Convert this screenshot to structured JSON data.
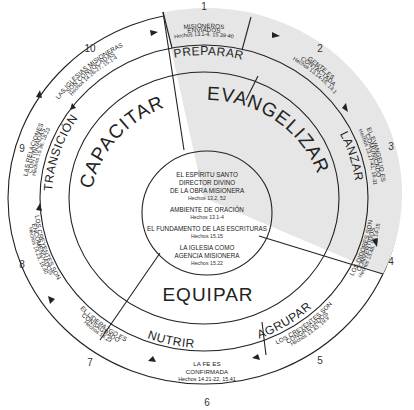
{
  "diagram": {
    "colors": {
      "shaded": "#e6e6e6",
      "white": "#ffffff",
      "line": "#222222"
    },
    "stages": [
      {
        "number": "1",
        "title_line1": "MISIONEROS",
        "title_line2": "ENVIADOS",
        "ref": "Hechos 13.1-4, 15.39-40"
      },
      {
        "number": "2",
        "title_line1": "GENTE ES",
        "title_line2": "CONTACTADA",
        "ref": "Hechos 13.14-16, 14.1"
      },
      {
        "number": "3",
        "title_line1": "EL EVANGELIO ES",
        "title_line2": "COMUNICADO",
        "ref": "Hechos 13.17-41, 16.31"
      },
      {
        "number": "4",
        "title_line1": "LOS OIDORES SON",
        "title_line2": "CONVERTIDOS",
        "ref": "Hechos 13.48, 16.14-15"
      },
      {
        "number": "5",
        "title_line1": "LOS CREYENTES SON",
        "title_line2": "CONGREGADOS",
        "ref": "Hechos 13.43, 19.9"
      },
      {
        "number": "6",
        "title_line1": "LA FE ES",
        "title_line2": "CONFIRMADA",
        "ref": "Hechos 14.21-22, 15.41"
      },
      {
        "number": "7",
        "title_line1": "EL LIDERAZGO ES",
        "title_line2": "CONSAGRADO",
        "ref": "Hechos 14.23"
      },
      {
        "number": "8",
        "title_line1": "LOS CREYENTES SON",
        "title_line2": "ENCOMENDADOS",
        "ref": "Hechos 14.23, 16.40"
      },
      {
        "number": "9",
        "title_line1": "LAS RELACIONES",
        "title_line2": "CONTINUADAS",
        "ref": "Hechos 15.36, 18.23"
      },
      {
        "number": "10",
        "title_line1": "LAS IGLESIAS MISIONERAS",
        "title_line2": "SON CONVOCADAS",
        "ref": "Hechos 14.26-27, 15.1-4"
      }
    ],
    "bands": {
      "preparar": "PREPARAR",
      "lanzar": "LANZAR",
      "agrupar": "AGRUPAR",
      "nutrir": "NUTRIR",
      "transicion": "TRANSICIÓN"
    },
    "sectors": {
      "evangelizar": "EVANGELIZAR",
      "capacitar": "CAPACITAR",
      "equipar": "EQUIPAR"
    },
    "center": {
      "item1_line1": "EL ESPÍRITU SANTO",
      "item1_line2": "DIRECTOR DIVINO",
      "item1_line3": "DE LA OBRA MISIONERA",
      "item1_ref": "Hechos 13.2, 52",
      "item2_line1": "AMBIENTE DE ORACIÓN",
      "item2_ref": "Hechos 13.1-4",
      "item3_line1": "EL FUNDAMENTO DE LAS ESCRITURAS",
      "item3_ref": "Hechos 15.15",
      "item4_line1": "LA IGLESIA COMO",
      "item4_line2": "AGENCIA MISIONERA",
      "item4_ref": "Hechos 15.22"
    }
  }
}
